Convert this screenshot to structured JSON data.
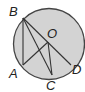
{
  "diagram": {
    "type": "circle-geometry",
    "circle": {
      "center_label": "O",
      "fill": "#d3d3d3",
      "stroke": "#444444"
    },
    "points": [
      {
        "label": "B",
        "x": 23,
        "y": 18,
        "lx": 9,
        "ly": 16
      },
      {
        "label": "A",
        "x": 23,
        "y": 65,
        "lx": 9,
        "ly": 78
      },
      {
        "label": "C",
        "x": 52,
        "y": 75,
        "lx": 46,
        "ly": 90
      },
      {
        "label": "D",
        "x": 71,
        "y": 65,
        "lx": 72,
        "ly": 74
      },
      {
        "label": "O",
        "x": 48,
        "y": 42,
        "lx": 47,
        "ly": 38
      }
    ],
    "segments": [
      [
        "B",
        "A"
      ],
      [
        "B",
        "C"
      ],
      [
        "B",
        "D"
      ],
      [
        "A",
        "O"
      ],
      [
        "O",
        "C"
      ]
    ]
  }
}
